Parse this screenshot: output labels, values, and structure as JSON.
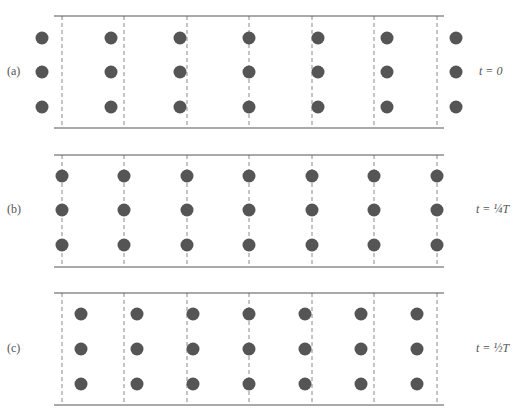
{
  "figure": {
    "colors": {
      "particle": "#555555",
      "rail": "#555555",
      "dashed": "#8a8a8a",
      "text": "#555555"
    },
    "rail_x": [
      54,
      444
    ],
    "dashed_x": [
      62,
      124,
      187,
      249,
      312,
      374,
      437
    ],
    "dot_radius": 6.5,
    "panels": [
      {
        "label": "(a)",
        "time": "t = 0",
        "top_y": 16,
        "bottom_y": 128,
        "row_y": [
          38,
          72,
          107
        ],
        "dot_x": [
          42,
          111,
          180,
          249,
          318,
          387,
          456
        ]
      },
      {
        "label": "(b)",
        "time": "t = ¼T",
        "top_y": 155,
        "bottom_y": 267,
        "row_y": [
          176,
          210,
          245
        ],
        "dot_x": [
          62,
          124,
          187,
          249,
          312,
          374,
          437
        ]
      },
      {
        "label": "(c)",
        "time": "t = ½T",
        "top_y": 293,
        "bottom_y": 405,
        "row_y": [
          314,
          349,
          384
        ],
        "dot_x": [
          81,
          137,
          193,
          249,
          305,
          361,
          417
        ]
      }
    ]
  }
}
